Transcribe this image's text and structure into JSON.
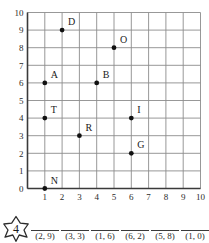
{
  "graph": {
    "x_axis": {
      "label": "",
      "ticks": [
        "1",
        "2",
        "3",
        "4",
        "5",
        "6",
        "7",
        "8",
        "9",
        "10"
      ],
      "min": 0,
      "max": 10
    },
    "y_axis": {
      "label": "",
      "ticks": [
        "0",
        "1",
        "2",
        "3",
        "4",
        "5",
        "6",
        "7",
        "8",
        "9",
        "10"
      ],
      "min": 0,
      "max": 10
    },
    "grid_color": "#8c8c8c",
    "axis_color": "#3a3a3a",
    "point_color": "#111111"
  },
  "chart_data": {
    "type": "scatter",
    "title": "",
    "xlabel": "",
    "ylabel": "",
    "xlim": [
      0,
      10
    ],
    "ylim": [
      0,
      10
    ],
    "grid": true,
    "legend": false,
    "points": [
      {
        "label": "D",
        "x": 2,
        "y": 9
      },
      {
        "label": "O",
        "x": 5,
        "y": 8
      },
      {
        "label": "A",
        "x": 1,
        "y": 6
      },
      {
        "label": "B",
        "x": 4,
        "y": 6
      },
      {
        "label": "T",
        "x": 1,
        "y": 4
      },
      {
        "label": "I",
        "x": 6,
        "y": 4
      },
      {
        "label": "R",
        "x": 3,
        "y": 3
      },
      {
        "label": "G",
        "x": 6,
        "y": 2
      },
      {
        "label": "N",
        "x": 1,
        "y": 0
      }
    ]
  },
  "question": {
    "number": "4",
    "answers": [
      {
        "coord": "(2, 9)",
        "blank": ""
      },
      {
        "coord": "(3, 3)",
        "blank": ""
      },
      {
        "coord": "(1, 6)",
        "blank": ""
      },
      {
        "coord": "(6, 2)",
        "blank": ""
      },
      {
        "coord": "(5, 8)",
        "blank": ""
      },
      {
        "coord": "(1, 0)",
        "blank": ""
      }
    ]
  }
}
